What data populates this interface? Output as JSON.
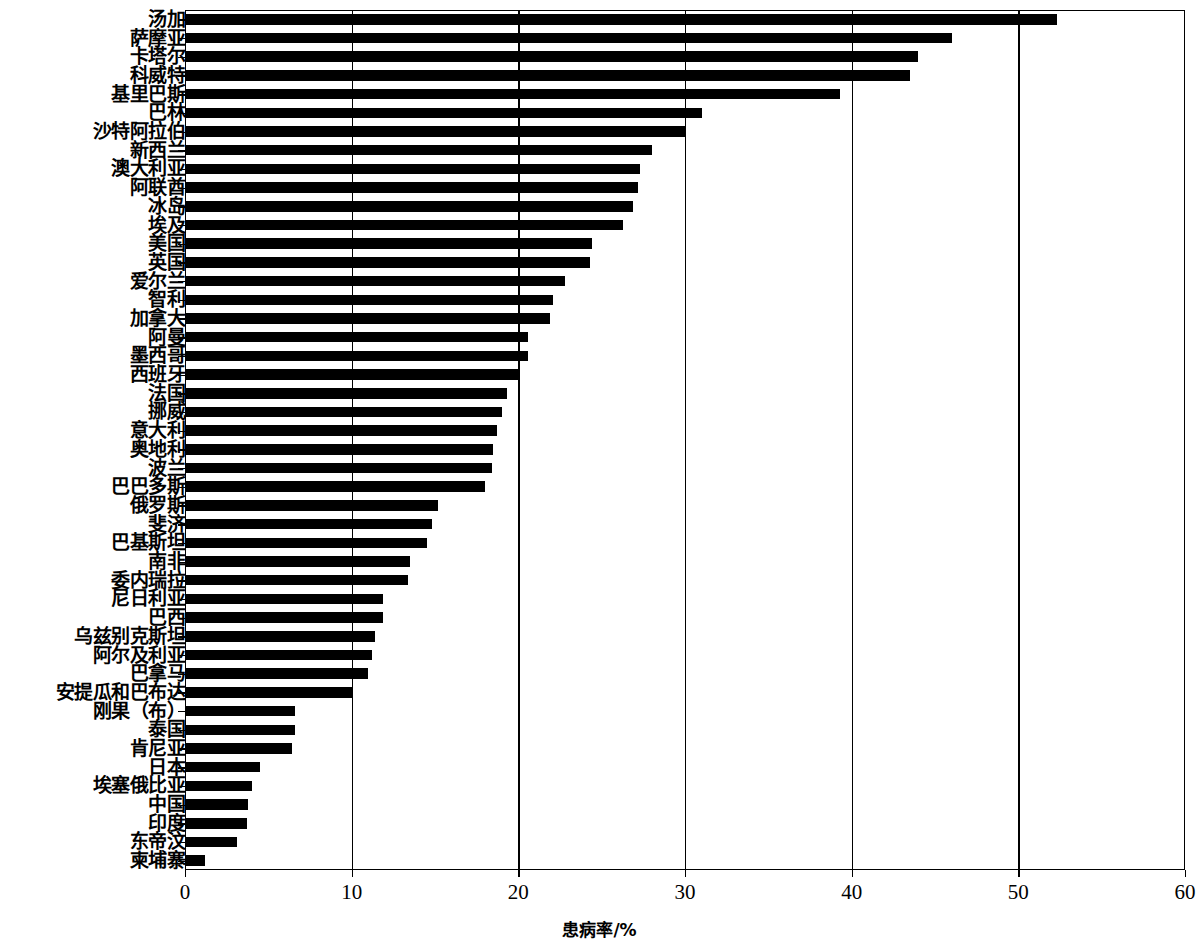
{
  "chart_data": {
    "type": "bar",
    "orientation": "horizontal",
    "title": "",
    "xlabel": "患病率/%",
    "ylabel": "国家名称",
    "xlim": [
      0,
      60
    ],
    "xticks": [
      0,
      10,
      20,
      30,
      40,
      50,
      60
    ],
    "xticklabels": [
      "0",
      "10",
      "20",
      "30",
      "40",
      "50",
      "60"
    ],
    "grid": "vertical",
    "legend": "none",
    "bar_color": "#000000",
    "categories": [
      "汤加",
      "萨摩亚",
      "卡塔尔",
      "科威特",
      "基里巴斯",
      "巴林",
      "沙特阿拉伯",
      "新西兰",
      "澳大利亚",
      "阿联酋",
      "冰岛",
      "埃及",
      "美国",
      "英国",
      "爱尔兰",
      "智利",
      "加拿大",
      "阿曼",
      "墨西哥",
      "西班牙",
      "法国",
      "挪威",
      "意大利",
      "奥地利",
      "波兰",
      "巴巴多斯",
      "俄罗斯",
      "斐济",
      "巴基斯坦",
      "南非",
      "委内瑞拉",
      "尼日利亚",
      "巴西",
      "乌兹别克斯坦",
      "阿尔及利亚",
      "巴拿马",
      "安提瓜和巴布达",
      "刚果（布）",
      "泰国",
      "肯尼亚",
      "日本",
      "埃塞俄比亚",
      "中国",
      "印度",
      "东帝汶",
      "柬埔寨"
    ],
    "values": [
      52.3,
      46.0,
      44.0,
      43.5,
      39.3,
      31.0,
      30.0,
      28.0,
      27.3,
      27.2,
      26.9,
      26.3,
      24.4,
      24.3,
      22.8,
      22.1,
      21.9,
      20.6,
      20.6,
      20.1,
      19.3,
      19.0,
      18.7,
      18.5,
      18.4,
      18.0,
      15.2,
      14.8,
      14.5,
      13.5,
      13.4,
      11.9,
      11.9,
      11.4,
      11.2,
      11.0,
      10.1,
      6.6,
      6.6,
      6.4,
      4.5,
      4.0,
      3.8,
      3.7,
      3.1,
      1.2
    ]
  }
}
